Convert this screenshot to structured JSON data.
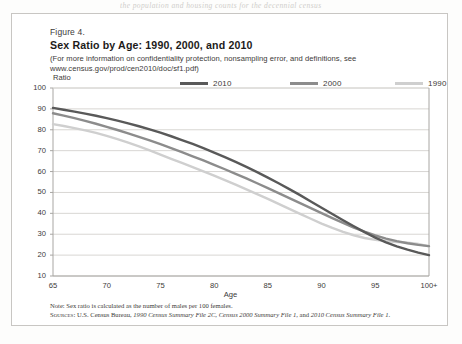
{
  "page": {
    "bleed_text": "the population and housing counts for the decennial census"
  },
  "figure": {
    "number": "Figure 4.",
    "title": "Sex Ratio by Age: 1990, 2000, and 2010",
    "subtitle_line1": "(For more information on confidentiality protection, nonsampling error, and definitions, see",
    "subtitle_line2": "www.census.gov/prod/cen2010/doc/sf1.pdf)",
    "note": "Note: Sex ratio is calculated as the number of males per 100 females.",
    "sources_label": "Sources:",
    "sources_plain1": " U.S. Census Bureau, ",
    "sources_em1": "1990 Census Summary File 2C",
    "sources_plain2": ", ",
    "sources_em2": "Census 2000 Summary File 1",
    "sources_plain3": ", and ",
    "sources_em3": "2010 Census Summary File 1",
    "sources_plain4": "."
  },
  "colors": {
    "series_2010": "#595959",
    "series_2000": "#8c8c8c",
    "series_1990": "#cfcfcf",
    "grid": "#d8d6d3",
    "frame": "#a8a6a3",
    "text": "#3c3a38"
  },
  "chart_data": {
    "type": "line",
    "title": "Sex Ratio by Age: 1990, 2000, and 2010",
    "xlabel": "Age",
    "ylabel": "Ratio",
    "xlim": [
      65,
      100
    ],
    "ylim": [
      10,
      100
    ],
    "grid": true,
    "legend_position": "top",
    "xtick_labels": [
      "65",
      "70",
      "75",
      "80",
      "85",
      "90",
      "95",
      "100+"
    ],
    "xtick_values": [
      65,
      70,
      75,
      80,
      85,
      90,
      95,
      100
    ],
    "ytick_labels": [
      "10",
      "20",
      "30",
      "40",
      "50",
      "60",
      "70",
      "80",
      "90",
      "100"
    ],
    "ytick_values": [
      10,
      20,
      30,
      40,
      50,
      60,
      70,
      80,
      90,
      100
    ],
    "x": [
      65,
      66,
      67,
      68,
      69,
      70,
      71,
      72,
      73,
      74,
      75,
      76,
      77,
      78,
      79,
      80,
      81,
      82,
      83,
      84,
      85,
      86,
      87,
      88,
      89,
      90,
      91,
      92,
      93,
      94,
      95,
      96,
      97,
      98,
      99,
      100
    ],
    "series": [
      {
        "name": "2010",
        "color": "#595959",
        "values": [
          90.5,
          89.6,
          88.7,
          87.7,
          86.7,
          85.6,
          84.4,
          83.1,
          81.7,
          80.2,
          78.6,
          76.9,
          75.1,
          73.2,
          71.2,
          69.1,
          66.9,
          64.6,
          62.2,
          59.7,
          57.1,
          54.4,
          51.6,
          48.7,
          45.7,
          42.7,
          39.7,
          36.7,
          33.8,
          31.0,
          28.4,
          26.1,
          24.2,
          22.6,
          21.2,
          20.0
        ]
      },
      {
        "name": "2000",
        "color": "#8c8c8c",
        "values": [
          87.9,
          86.8,
          85.6,
          84.3,
          82.9,
          81.4,
          79.9,
          78.3,
          76.6,
          74.9,
          73.1,
          71.2,
          69.3,
          67.3,
          65.3,
          63.2,
          61.1,
          58.9,
          56.7,
          54.4,
          52.1,
          49.7,
          47.3,
          44.9,
          42.5,
          40.1,
          37.7,
          35.4,
          33.2,
          31.2,
          29.4,
          27.9,
          26.7,
          25.7,
          24.9,
          24.3
        ]
      },
      {
        "name": "1990",
        "color": "#cfcfcf",
        "values": [
          82.7,
          81.8,
          80.8,
          79.7,
          78.5,
          77.1,
          75.5,
          73.8,
          72.0,
          70.1,
          68.1,
          66.1,
          64.1,
          62.1,
          60.1,
          58.0,
          55.9,
          53.7,
          51.5,
          49.2,
          46.9,
          44.5,
          42.1,
          39.7,
          37.4,
          35.1,
          33.0,
          31.1,
          29.5,
          28.2,
          27.3,
          26.7,
          26.3,
          26.0,
          25.3,
          24.2
        ]
      }
    ]
  }
}
